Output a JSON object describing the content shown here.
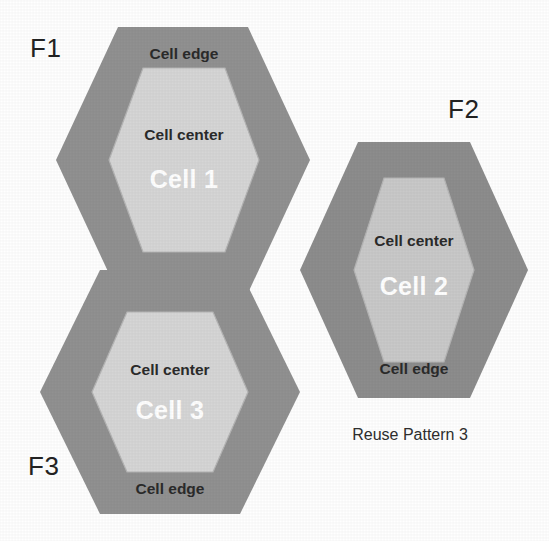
{
  "figure": {
    "caption": "Reuse Pattern 3",
    "background_color": "#ffffff",
    "edge_color": "#919191",
    "center_color": "#d6d6d6",
    "label_color": "#2b2b2b",
    "cell_name_color": "#ffffff"
  },
  "cells": [
    {
      "id": "cell-1",
      "name": "Cell 1",
      "frequency_label": "F1",
      "edge_label": "Cell edge",
      "center_label": "Cell center"
    },
    {
      "id": "cell-2",
      "name": "Cell 2",
      "frequency_label": "F2",
      "edge_label": "Cell edge",
      "center_label": "Cell center"
    },
    {
      "id": "cell-3",
      "name": "Cell 3",
      "frequency_label": "F3",
      "edge_label": "Cell edge",
      "center_label": "Cell center"
    }
  ]
}
